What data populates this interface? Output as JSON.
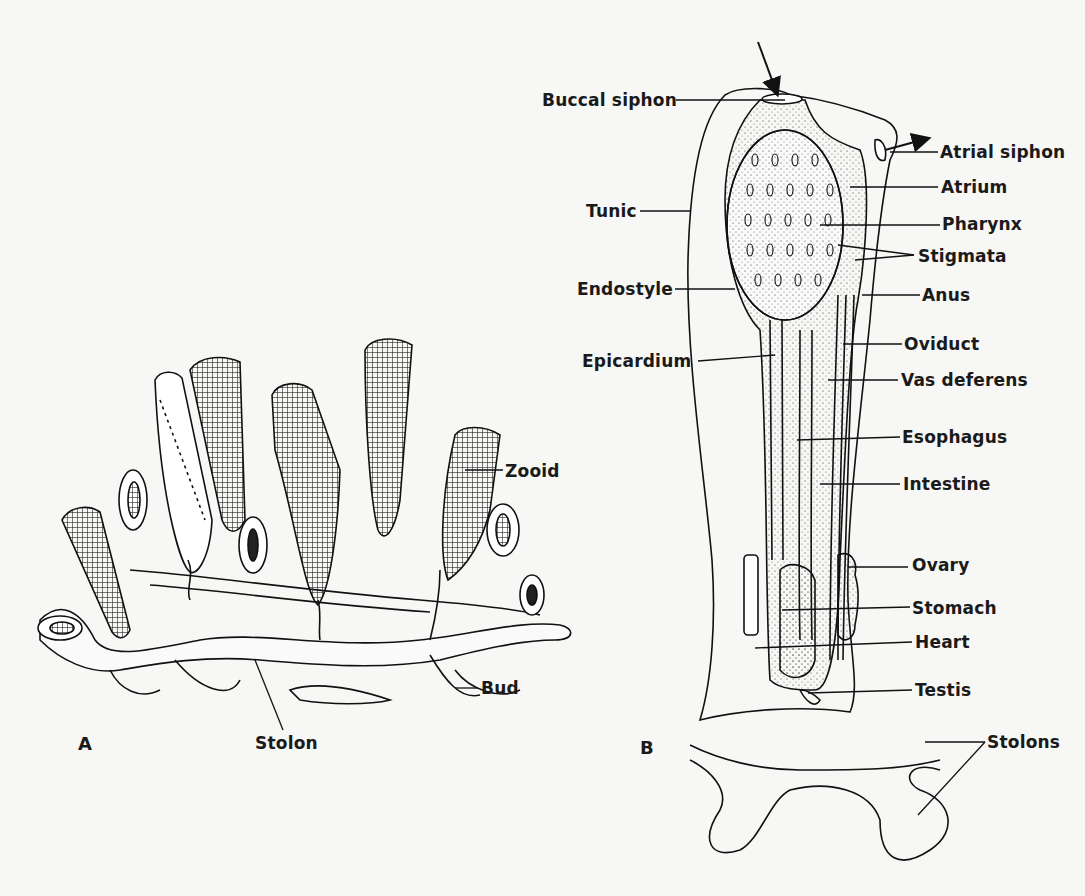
{
  "figure": {
    "panel_a": {
      "letter": "A",
      "labels": {
        "zooid": "Zooid",
        "bud": "Bud",
        "stolon": "Stolon"
      }
    },
    "panel_b": {
      "letter": "B",
      "labels": {
        "buccal_siphon": "Buccal siphon",
        "atrial_siphon": "Atrial siphon",
        "atrium": "Atrium",
        "tunic": "Tunic",
        "pharynx": "Pharynx",
        "stigmata": "Stigmata",
        "endostyle": "Endostyle",
        "anus": "Anus",
        "oviduct": "Oviduct",
        "epicardium": "Epicardium",
        "vas_deferens": "Vas deferens",
        "esophagus": "Esophagus",
        "intestine": "Intestine",
        "ovary": "Ovary",
        "stomach": "Stomach",
        "heart": "Heart",
        "testis": "Testis",
        "stolons": "Stolons"
      }
    },
    "colors": {
      "ink": "#1a1a1a",
      "paper": "#f7f7f5"
    }
  }
}
